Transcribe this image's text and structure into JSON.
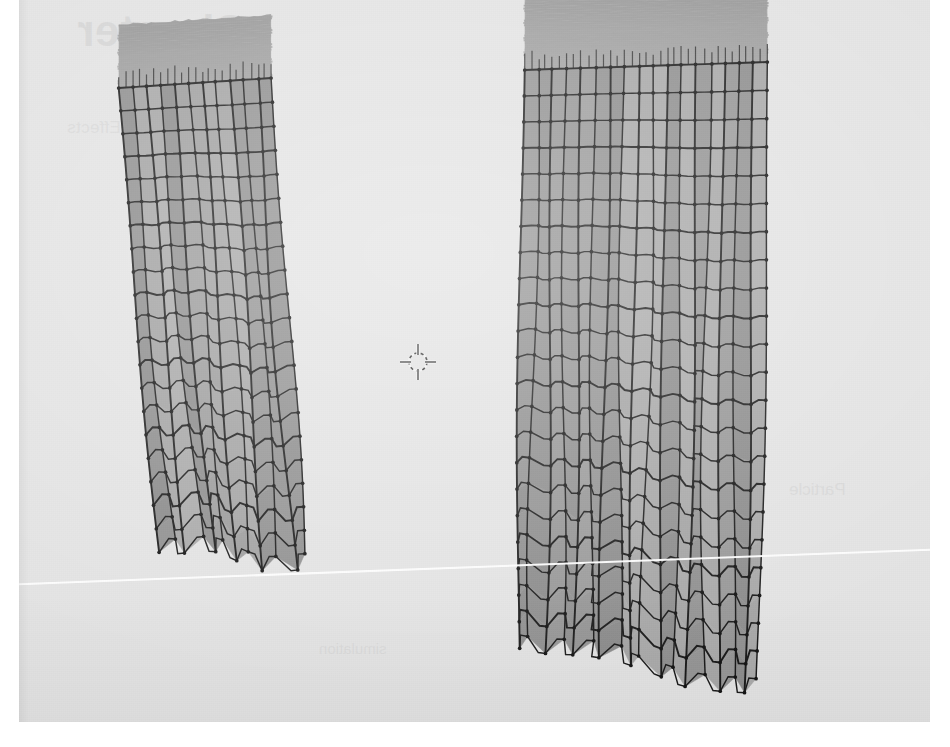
{
  "application": {
    "name": "Blender",
    "view_mode": "Edit Mode",
    "shading": "Solid",
    "viewport_background_color": "#e4e4e4",
    "page_background_color": "#ffffff"
  },
  "page_showthrough": {
    "note": "Faint mirrored print bleeding through the scanned page",
    "heading": "Chapter",
    "subtitle": "Environmental Effects",
    "side_text": "Particle",
    "lower_text": "simulation"
  },
  "viewport": {
    "label": "3d-viewport",
    "x": 19,
    "y": 0,
    "width": 911,
    "height": 722
  },
  "horizon": {
    "label": "floor-grid-x-axis-line",
    "color": "#ffffff",
    "thickness": 2,
    "x1": 0,
    "y1": 585,
    "x2": 950,
    "y2": 549
  },
  "cursor_3d": {
    "label": "3d-cursor",
    "x": 399,
    "y": 362,
    "radius": 9,
    "color_dark": "#3a3a3a",
    "color_light": "#f2f2f2"
  },
  "objects": [
    {
      "name": "cloth-plane-left",
      "selected": false,
      "mode": "wireframe-over-solid",
      "face_color": "#a8a8a8",
      "wire_color": "#1a1a1a",
      "vertex_color": "#141414",
      "columns": 11,
      "rows": 20,
      "compressed_top_rows": 26,
      "bounds": {
        "x": 85,
        "y": 60,
        "width": 240,
        "height": 520
      },
      "corners": {
        "top_left": {
          "x": 118,
          "y": 88
        },
        "top_right": {
          "x": 272,
          "y": 78
        },
        "bottom_right": {
          "x": 305,
          "y": 565
        },
        "bottom_left": {
          "x": 158,
          "y": 540
        }
      }
    },
    {
      "name": "cloth-plane-right",
      "selected": false,
      "mode": "wireframe-over-solid",
      "face_color": "#a3a3a3",
      "wire_color": "#1a1a1a",
      "vertex_color": "#141414",
      "columns": 17,
      "rows": 22,
      "compressed_top_rows": 30,
      "bounds": {
        "x": 470,
        "y": 40,
        "width": 310,
        "height": 670
      },
      "corners": {
        "top_left": {
          "x": 524,
          "y": 70
        },
        "top_right": {
          "x": 768,
          "y": 62
        },
        "bottom_right": {
          "x": 760,
          "y": 690
        },
        "bottom_left": {
          "x": 516,
          "y": 636
        }
      }
    }
  ],
  "colors": {
    "viewport_bg": "#e4e4e4",
    "mesh_face": "#a8a8a8",
    "mesh_face_shadow": "#8e8e8e",
    "wireframe": "#1a1a1a",
    "horizon": "#ffffff",
    "paper": "#ffffff"
  }
}
